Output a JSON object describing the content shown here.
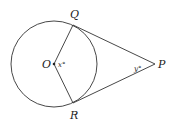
{
  "diagram": {
    "points": {
      "O": {
        "label": "O",
        "x": 54,
        "y": 64
      },
      "Q": {
        "label": "Q",
        "x": 73,
        "y": 25
      },
      "R": {
        "label": "R",
        "x": 73,
        "y": 103
      },
      "P": {
        "label": "P",
        "x": 155,
        "y": 64
      }
    },
    "circle": {
      "cx": 54,
      "cy": 64,
      "r": 43
    },
    "angles": {
      "central": {
        "label": "x°",
        "at": "O"
      },
      "external": {
        "label": "y°",
        "at": "P"
      }
    },
    "colors": {
      "stroke": "#333333",
      "text": "#222222"
    }
  }
}
